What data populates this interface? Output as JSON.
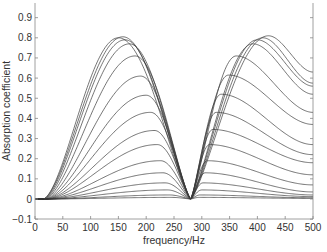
{
  "chart_data": {
    "type": "line",
    "title": "",
    "xlabel": "frequency/Hz",
    "ylabel": "Absorption coefficient",
    "xlim": [
      0,
      500
    ],
    "ylim": [
      -0.1,
      0.95
    ],
    "xticks": [
      0,
      50,
      100,
      150,
      200,
      250,
      300,
      350,
      400,
      450,
      500
    ],
    "xtick_labels": [
      "0",
      "50",
      "100",
      "150",
      "200",
      "250",
      "300",
      "350",
      "400",
      "450",
      "500"
    ],
    "yticks": [
      -0.1,
      0,
      0.1,
      0.2,
      0.3,
      0.4,
      0.5,
      0.6,
      0.7,
      0.8,
      0.9
    ],
    "ytick_labels": [
      "-0.1",
      "0",
      "0.1",
      "0.2",
      "0.3",
      "0.4",
      "0.5",
      "0.6",
      "0.7",
      "0.8",
      "0.9"
    ],
    "grid": false,
    "legend": null,
    "dip_frequency": 280,
    "series": [
      {
        "name": "curve-1",
        "start": 15,
        "left_peak": [
          158,
          0.805
        ],
        "right_peak": [
          420,
          0.81
        ],
        "end_value": 0.63
      },
      {
        "name": "curve-2",
        "start": 15,
        "left_peak": [
          150,
          0.8
        ],
        "right_peak": [
          410,
          0.8
        ],
        "end_value": 0.575
      },
      {
        "name": "curve-3",
        "start": 16,
        "left_peak": [
          162,
          0.79
        ],
        "right_peak": [
          400,
          0.79
        ],
        "end_value": 0.56
      },
      {
        "name": "curve-4",
        "start": 17,
        "left_peak": [
          170,
          0.77
        ],
        "right_peak": [
          392,
          0.77
        ],
        "end_value": 0.52
      },
      {
        "name": "curve-5",
        "start": 18,
        "left_peak": [
          180,
          0.71
        ],
        "right_peak": [
          362,
          0.71
        ],
        "end_value": 0.43
      },
      {
        "name": "curve-6",
        "start": 19,
        "left_peak": [
          190,
          0.61
        ],
        "right_peak": [
          348,
          0.615
        ],
        "end_value": 0.37
      },
      {
        "name": "curve-7",
        "start": 20,
        "left_peak": [
          200,
          0.515
        ],
        "right_peak": [
          335,
          0.52
        ],
        "end_value": 0.27
      },
      {
        "name": "curve-8",
        "start": 21,
        "left_peak": [
          208,
          0.43
        ],
        "right_peak": [
          326,
          0.43
        ],
        "end_value": 0.22
      },
      {
        "name": "curve-9",
        "start": 22,
        "left_peak": [
          215,
          0.34
        ],
        "right_peak": [
          320,
          0.345
        ],
        "end_value": 0.18
      },
      {
        "name": "curve-10",
        "start": 23,
        "left_peak": [
          220,
          0.27
        ],
        "right_peak": [
          314,
          0.27
        ],
        "end_value": 0.12
      },
      {
        "name": "curve-11",
        "start": 24,
        "left_peak": [
          226,
          0.19
        ],
        "right_peak": [
          310,
          0.19
        ],
        "end_value": 0.07
      },
      {
        "name": "curve-12",
        "start": 25,
        "left_peak": [
          230,
          0.13
        ],
        "right_peak": [
          306,
          0.13
        ],
        "end_value": 0.035
      },
      {
        "name": "curve-13",
        "start": 26,
        "left_peak": [
          234,
          0.08
        ],
        "right_peak": [
          302,
          0.08
        ],
        "end_value": 0.02
      },
      {
        "name": "curve-14",
        "start": 27,
        "left_peak": [
          238,
          0.045
        ],
        "right_peak": [
          300,
          0.045
        ],
        "end_value": 0.012
      },
      {
        "name": "curve-15",
        "start": 28,
        "left_peak": [
          242,
          0.02
        ],
        "right_peak": [
          297,
          0.02
        ],
        "end_value": 0.006
      },
      {
        "name": "curve-16",
        "start": 29,
        "left_peak": [
          246,
          0.008
        ],
        "right_peak": [
          295,
          0.008
        ],
        "end_value": 0.003
      }
    ]
  }
}
